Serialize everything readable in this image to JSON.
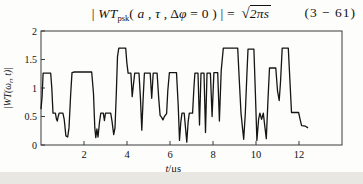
{
  "equation": {
    "bar1": "| ",
    "wt": "WT",
    "sub": "psk",
    "open_paren": "( ",
    "var_a": "a",
    "comma1": " , ",
    "var_tau": "τ",
    "comma2": " , ",
    "delta": "Δ",
    "phi": "φ",
    "rest": " = 0 ) | = ",
    "radical_sign": "√",
    "radicand": "2πs",
    "number": "(3 − 61)"
  },
  "chart_data": {
    "type": "line",
    "title": "",
    "xlabel_parts": [
      "t",
      "/μs"
    ],
    "ylabel_parts": [
      "|WT(ω",
      "r",
      ", t)|"
    ],
    "xlim": [
      0,
      14
    ],
    "ylim": [
      0,
      2
    ],
    "xticks": [
      2,
      4,
      6,
      8,
      10,
      12
    ],
    "yticks": [
      0,
      0.5,
      1,
      1.5,
      2
    ],
    "grid": false,
    "legend": "none",
    "line_color": "#151515",
    "frame_color": "#3a3a3a",
    "series": [
      {
        "name": "wavelet-transform-magnitude",
        "points": [
          [
            0.0,
            0.63
          ],
          [
            0.05,
            0.85
          ],
          [
            0.1,
            1.26
          ],
          [
            0.45,
            1.26
          ],
          [
            0.5,
            1.0
          ],
          [
            0.56,
            0.56
          ],
          [
            0.67,
            0.56
          ],
          [
            0.72,
            0.45
          ],
          [
            0.76,
            0.42
          ],
          [
            0.8,
            0.5
          ],
          [
            0.84,
            0.56
          ],
          [
            1.02,
            0.56
          ],
          [
            1.08,
            0.45
          ],
          [
            1.16,
            0.16
          ],
          [
            1.24,
            0.14
          ],
          [
            1.3,
            0.3
          ],
          [
            1.38,
            0.9
          ],
          [
            1.44,
            1.27
          ],
          [
            1.55,
            1.28
          ],
          [
            2.36,
            1.28
          ],
          [
            2.44,
            0.9
          ],
          [
            2.5,
            0.3
          ],
          [
            2.55,
            0.13
          ],
          [
            2.6,
            0.28
          ],
          [
            2.65,
            0.14
          ],
          [
            2.72,
            0.4
          ],
          [
            2.78,
            0.56
          ],
          [
            2.9,
            0.56
          ],
          [
            2.95,
            0.43
          ],
          [
            3.0,
            0.56
          ],
          [
            3.24,
            0.56
          ],
          [
            3.3,
            0.42
          ],
          [
            3.38,
            0.18
          ],
          [
            3.44,
            0.3
          ],
          [
            3.5,
            0.9
          ],
          [
            3.56,
            1.55
          ],
          [
            3.62,
            1.7
          ],
          [
            3.94,
            1.7
          ],
          [
            3.99,
            1.45
          ],
          [
            4.05,
            1.26
          ],
          [
            4.18,
            1.26
          ],
          [
            4.24,
            0.85
          ],
          [
            4.3,
            1.05
          ],
          [
            4.36,
            1.26
          ],
          [
            4.56,
            1.26
          ],
          [
            4.63,
            0.8
          ],
          [
            4.69,
            0.26
          ],
          [
            4.75,
            0.8
          ],
          [
            4.81,
            1.26
          ],
          [
            5.08,
            1.26
          ],
          [
            5.15,
            0.82
          ],
          [
            5.22,
            1.26
          ],
          [
            5.4,
            1.26
          ],
          [
            5.48,
            0.8
          ],
          [
            5.54,
            0.52
          ],
          [
            5.62,
            0.48
          ],
          [
            5.67,
            0.44
          ],
          [
            5.74,
            0.5
          ],
          [
            5.84,
            0.55
          ],
          [
            5.9,
            0.95
          ],
          [
            5.97,
            1.27
          ],
          [
            6.3,
            1.27
          ],
          [
            6.38,
            0.7
          ],
          [
            6.44,
            0.08
          ],
          [
            6.5,
            0.4
          ],
          [
            6.56,
            0.56
          ],
          [
            6.66,
            0.56
          ],
          [
            6.72,
            0.3
          ],
          [
            6.78,
            0.05
          ],
          [
            6.84,
            0.4
          ],
          [
            6.9,
            0.56
          ],
          [
            7.05,
            0.56
          ],
          [
            7.11,
            1.0
          ],
          [
            7.16,
            1.26
          ],
          [
            7.3,
            1.26
          ],
          [
            7.37,
            0.35
          ],
          [
            7.44,
            1.26
          ],
          [
            7.58,
            1.26
          ],
          [
            7.65,
            0.22
          ],
          [
            7.72,
            1.26
          ],
          [
            7.88,
            1.26
          ],
          [
            7.96,
            0.5
          ],
          [
            8.04,
            1.27
          ],
          [
            8.22,
            1.27
          ],
          [
            8.3,
            0.42
          ],
          [
            8.38,
            1.3
          ],
          [
            8.48,
            1.7
          ],
          [
            9.15,
            1.7
          ],
          [
            9.23,
            1.1
          ],
          [
            9.3,
            0.56
          ],
          [
            9.37,
            0.3
          ],
          [
            9.43,
            0.1
          ],
          [
            9.5,
            0.55
          ],
          [
            9.57,
            1.2
          ],
          [
            9.63,
            1.68
          ],
          [
            9.9,
            1.68
          ],
          [
            9.97,
            0.9
          ],
          [
            10.04,
            0.08
          ],
          [
            10.12,
            0.45
          ],
          [
            10.18,
            0.56
          ],
          [
            10.26,
            0.45
          ],
          [
            10.34,
            0.56
          ],
          [
            10.42,
            0.3
          ],
          [
            10.48,
            0.11
          ],
          [
            10.56,
            0.8
          ],
          [
            10.63,
            1.35
          ],
          [
            10.92,
            1.35
          ],
          [
            11.0,
            0.95
          ],
          [
            11.08,
            0.78
          ],
          [
            11.14,
            1.1
          ],
          [
            11.22,
            1.7
          ],
          [
            11.5,
            1.7
          ],
          [
            11.58,
            1.1
          ],
          [
            11.65,
            0.57
          ],
          [
            11.98,
            0.57
          ],
          [
            12.05,
            0.45
          ],
          [
            12.12,
            0.34
          ],
          [
            12.3,
            0.33
          ],
          [
            12.42,
            0.3
          ]
        ]
      }
    ]
  }
}
